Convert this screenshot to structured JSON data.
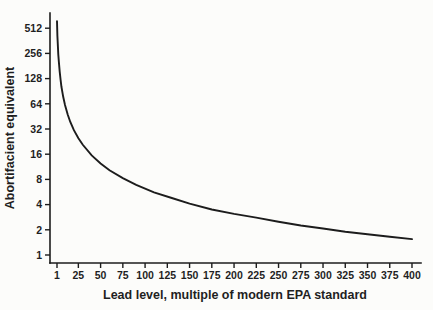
{
  "figure": {
    "background_color": "#fcfcfa",
    "axis_color": "#1c1c1c",
    "curve_color": "#1c1c1c",
    "text_color": "#1f1f1f"
  },
  "chart_data": {
    "type": "line",
    "title": "",
    "xlabel": "Lead level, multiple of modern EPA standard",
    "ylabel": "Abortifacient equivalent",
    "x_scale": "linear",
    "y_scale": "log2",
    "xlim": [
      1,
      400
    ],
    "ylim": [
      1,
      620
    ],
    "x_ticks": [
      1,
      25,
      50,
      75,
      100,
      125,
      150,
      175,
      200,
      225,
      250,
      275,
      300,
      325,
      350,
      375,
      400
    ],
    "y_ticks": [
      1,
      2,
      4,
      8,
      16,
      32,
      64,
      128,
      256,
      512
    ],
    "grid": false,
    "legend": "none",
    "series": [
      {
        "name": "abortifacient-equivalent-vs-lead-level",
        "x": [
          1,
          1.5,
          2,
          2.5,
          3,
          4,
          5,
          6,
          8,
          10,
          13,
          16,
          20,
          25,
          30,
          40,
          50,
          60,
          75,
          90,
          110,
          130,
          150,
          175,
          200,
          225,
          250,
          275,
          300,
          325,
          350,
          375,
          400
        ],
        "y": [
          620,
          413,
          310,
          248,
          207,
          155,
          124,
          103,
          77.5,
          62,
          47.7,
          38.8,
          31,
          24.8,
          20.7,
          15.5,
          12.4,
          10.3,
          8.3,
          6.9,
          5.6,
          4.8,
          4.1,
          3.5,
          3.1,
          2.8,
          2.5,
          2.25,
          2.07,
          1.9,
          1.77,
          1.65,
          1.55
        ]
      }
    ]
  }
}
